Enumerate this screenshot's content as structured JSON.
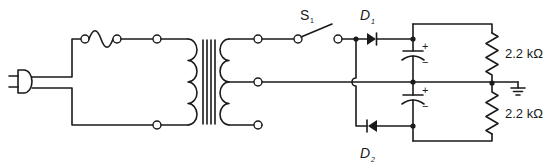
{
  "diagram": {
    "type": "circuit-schematic",
    "components": {
      "plug": {
        "label": ""
      },
      "fuse": {
        "label": ""
      },
      "transformer": {
        "label": "",
        "secondary": "center-tapped"
      },
      "switch": {
        "label_main": "S",
        "label_sub": "1"
      },
      "diode_1": {
        "label_main": "D",
        "label_sub": "1"
      },
      "diode_2": {
        "label_main": "D",
        "label_sub": "2"
      },
      "capacitor_1": {
        "plus": "+",
        "minus": "−"
      },
      "capacitor_2": {
        "plus": "+",
        "minus": "−"
      },
      "resistor_1": {
        "label": "2.2 kΩ"
      },
      "resistor_2": {
        "label": "2.2 kΩ"
      },
      "ground": {
        "label": ""
      }
    },
    "colors": {
      "ink": "#1a1a1a",
      "background": "#ffffff"
    }
  }
}
